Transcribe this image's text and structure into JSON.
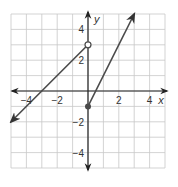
{
  "chart_data": {
    "type": "line",
    "title": "",
    "xlabel": "x",
    "ylabel": "y",
    "xlim": [
      -5,
      5
    ],
    "ylim": [
      -5,
      5
    ],
    "grid": true,
    "x_tick_labels": [
      "-4",
      "-2",
      "2",
      "4"
    ],
    "x_tick_values": [
      -4,
      -2,
      2,
      4
    ],
    "y_tick_labels": [
      "4",
      "2",
      "-2",
      "-4"
    ],
    "y_tick_values": [
      4,
      2,
      -2,
      -4
    ],
    "series": [
      {
        "name": "left piece",
        "equation": "y = x + 3",
        "domain": "x < 0",
        "start": {
          "x": -5,
          "y": -2,
          "end_style": "arrow"
        },
        "end": {
          "x": 0,
          "y": 3,
          "end_style": "open-circle"
        }
      },
      {
        "name": "right piece",
        "equation": "y = 2x - 1",
        "domain": "x >= 0",
        "start": {
          "x": 0,
          "y": -1,
          "end_style": "closed-circle"
        },
        "end": {
          "x": 3,
          "y": 5,
          "end_style": "arrow"
        }
      }
    ],
    "colors": {
      "grid": "#c8c8c8",
      "axis": "#222222",
      "line": "#4a4a4a"
    }
  }
}
